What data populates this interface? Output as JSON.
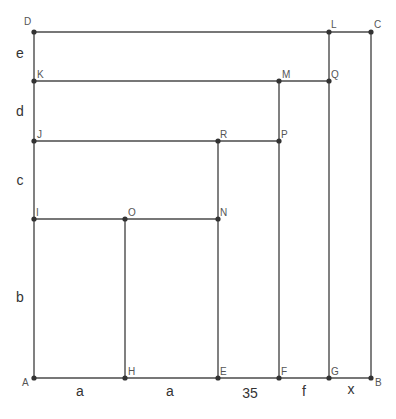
{
  "diagram": {
    "title": "",
    "points": [
      {
        "id": "A",
        "x": 34,
        "y": 378,
        "lx": 22,
        "ly": 386
      },
      {
        "id": "D",
        "x": 34,
        "y": 32,
        "lx": 24,
        "ly": 25
      },
      {
        "id": "C",
        "x": 371,
        "y": 32,
        "lx": 374,
        "ly": 28
      },
      {
        "id": "B",
        "x": 371,
        "y": 378,
        "lx": 375,
        "ly": 386
      },
      {
        "id": "H",
        "x": 125,
        "y": 378,
        "lx": 128,
        "ly": 375
      },
      {
        "id": "E",
        "x": 218,
        "y": 378,
        "lx": 220,
        "ly": 375
      },
      {
        "id": "F",
        "x": 279,
        "y": 378,
        "lx": 281,
        "ly": 375
      },
      {
        "id": "G",
        "x": 329,
        "y": 378,
        "lx": 331,
        "ly": 375
      },
      {
        "id": "L",
        "x": 329,
        "y": 32,
        "lx": 331,
        "ly": 28
      },
      {
        "id": "K",
        "x": 34,
        "y": 81,
        "lx": 37,
        "ly": 78
      },
      {
        "id": "M",
        "x": 279,
        "y": 81,
        "lx": 282,
        "ly": 78
      },
      {
        "id": "Q",
        "x": 329,
        "y": 81,
        "lx": 331,
        "ly": 78
      },
      {
        "id": "J",
        "x": 34,
        "y": 141,
        "lx": 37,
        "ly": 138
      },
      {
        "id": "R",
        "x": 218,
        "y": 141,
        "lx": 220,
        "ly": 138
      },
      {
        "id": "P",
        "x": 279,
        "y": 141,
        "lx": 281,
        "ly": 138
      },
      {
        "id": "I",
        "x": 34,
        "y": 219,
        "lx": 36,
        "ly": 216
      },
      {
        "id": "O",
        "x": 125,
        "y": 219,
        "lx": 128,
        "ly": 216
      },
      {
        "id": "N",
        "x": 218,
        "y": 219,
        "lx": 220,
        "ly": 216
      }
    ],
    "segments": [
      [
        "A",
        "B"
      ],
      [
        "A",
        "D"
      ],
      [
        "D",
        "C"
      ],
      [
        "C",
        "B"
      ],
      [
        "L",
        "G"
      ],
      [
        "K",
        "Q"
      ],
      [
        "M",
        "F"
      ],
      [
        "J",
        "P"
      ],
      [
        "R",
        "E"
      ],
      [
        "I",
        "N"
      ],
      [
        "O",
        "H"
      ]
    ],
    "segment_labels": [
      {
        "text": "a",
        "x": 80,
        "y": 396,
        "side": "bottom"
      },
      {
        "text": "a",
        "x": 170,
        "y": 396,
        "side": "bottom"
      },
      {
        "text": "35",
        "x": 250,
        "y": 398,
        "side": "bottom"
      },
      {
        "text": "f",
        "x": 304,
        "y": 396,
        "side": "bottom"
      },
      {
        "text": "x",
        "x": 351,
        "y": 394,
        "side": "bottom"
      },
      {
        "text": "e",
        "x": 20,
        "y": 58,
        "side": "left"
      },
      {
        "text": "d",
        "x": 20,
        "y": 116,
        "side": "left"
      },
      {
        "text": "c",
        "x": 20,
        "y": 185,
        "side": "left"
      },
      {
        "text": "b",
        "x": 20,
        "y": 302,
        "side": "left"
      }
    ]
  }
}
